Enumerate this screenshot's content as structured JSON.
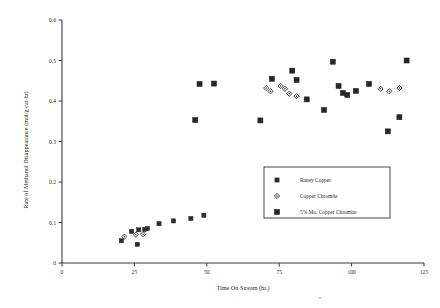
{
  "chart_data": {
    "type": "scatter",
    "title": "",
    "xlabel": "Time On Stream (hr.)",
    "ylabel": "Rate of Methanol Disappearance (mol/g cat-hr)",
    "xlim": [
      0,
      125
    ],
    "ylim": [
      0,
      0.6
    ],
    "xticks": [
      0,
      25,
      50,
      75,
      100,
      125
    ],
    "xtick_labels": [
      "0",
      "25",
      "50",
      "75",
      "100",
      "125"
    ],
    "yticks": [
      0,
      0.1,
      0.2,
      0.3,
      0.4,
      0.5,
      0.6
    ],
    "ytick_labels": [
      "0",
      "0.1",
      "0.2",
      "0.3",
      "0.4",
      "0.5",
      "0.6"
    ],
    "grid": false,
    "legend_position": "lower-right-inside",
    "series": [
      {
        "name": "Raney Copper",
        "marker": "filled-square",
        "points": [
          [
            20.5,
            0.055
          ],
          [
            24.0,
            0.078
          ],
          [
            26.5,
            0.082
          ],
          [
            28.5,
            0.083
          ],
          [
            29.5,
            0.085
          ],
          [
            26.0,
            0.046
          ],
          [
            33.5,
            0.097
          ],
          [
            38.5,
            0.104
          ],
          [
            44.5,
            0.11
          ],
          [
            49.0,
            0.118
          ]
        ]
      },
      {
        "name": "Copper Chromite",
        "marker": "open-diamond",
        "points": [
          [
            21.5,
            0.065
          ],
          [
            25.5,
            0.07
          ],
          [
            28.0,
            0.071
          ],
          [
            70.5,
            0.432
          ],
          [
            72.0,
            0.424
          ],
          [
            75.5,
            0.437
          ],
          [
            77.0,
            0.43
          ],
          [
            78.5,
            0.418
          ],
          [
            81.0,
            0.412
          ],
          [
            110.0,
            0.43
          ],
          [
            113.0,
            0.424
          ],
          [
            116.5,
            0.432
          ]
        ]
      },
      {
        "name": "5% Mo. Copper Chromite",
        "marker": "filled-square-large",
        "points": [
          [
            46.0,
            0.353
          ],
          [
            47.5,
            0.442
          ],
          [
            52.5,
            0.443
          ],
          [
            68.5,
            0.352
          ],
          [
            72.5,
            0.455
          ],
          [
            79.5,
            0.475
          ],
          [
            81.0,
            0.452
          ],
          [
            84.5,
            0.404
          ],
          [
            90.5,
            0.378
          ],
          [
            93.5,
            0.497
          ],
          [
            95.5,
            0.437
          ],
          [
            97.0,
            0.42
          ],
          [
            98.5,
            0.415
          ],
          [
            101.5,
            0.425
          ],
          [
            106.0,
            0.442
          ],
          [
            112.5,
            0.325
          ],
          [
            116.5,
            0.36
          ],
          [
            119.0,
            0.5
          ]
        ]
      }
    ]
  },
  "plot": {
    "legend_entries": [
      {
        "label": "Raney Copper",
        "marker": "filled-square"
      },
      {
        "label": "Copper Chromite",
        "marker": "open-diamond"
      },
      {
        "label": "5% Mo. Copper Chromite",
        "marker": "filled-square-large"
      }
    ]
  },
  "colors": {
    "marker": "#2b2b2b",
    "axis": "#3b3b3b",
    "background": "#ffffff",
    "text": "#1f1f1f"
  }
}
